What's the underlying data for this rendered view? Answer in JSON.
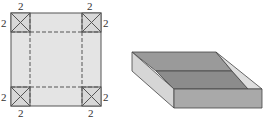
{
  "net": {
    "corner_size_label": "2",
    "labels": {
      "top_left": "2",
      "top_right": "2",
      "left_top": "2",
      "right_top": "2",
      "left_bottom": "2",
      "right_bottom": "2",
      "bottom_left": "2",
      "bottom_right": "2"
    },
    "colors": {
      "fill": "#e4e4e4",
      "corner_fill": "#d8d8d8",
      "stroke": "#555555",
      "dash": "#555555"
    }
  },
  "box": {
    "colors": {
      "back_wall": "#9a9a9a",
      "floor": "#8a8a8a",
      "left_wall_outer": "#d6d6d6",
      "right_wall_inner": "#dedede",
      "front_wall": "#a8a8a8",
      "stroke": "#444444"
    }
  }
}
